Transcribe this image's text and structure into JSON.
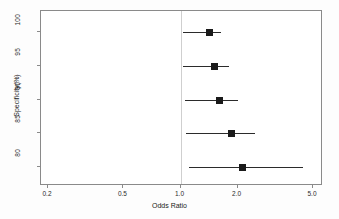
{
  "chart_data": {
    "type": "scatter",
    "subtype": "forest-plot",
    "title": "",
    "xlabel": "Odds Ratio",
    "ylabel": "Specificity(%)",
    "xscale": "log",
    "xlim": [
      0.2,
      5.0
    ],
    "xticks": [
      "0.2",
      "0.5",
      "1.0",
      "2.0",
      "5.0"
    ],
    "xtick_values": [
      0.2,
      0.5,
      1.0,
      2.0,
      5.0
    ],
    "yticks": [
      "100",
      "95",
      "90",
      "85",
      "80"
    ],
    "ytick_values": [
      100,
      95,
      90,
      85,
      80
    ],
    "grid": false,
    "legend": "none",
    "reference_line": 1.0,
    "categories": [
      100,
      95,
      90,
      85,
      80
    ],
    "points": [
      {
        "category": "100",
        "odds_ratio": 1.41,
        "ci_low": 1.03,
        "ci_high": 1.64
      },
      {
        "category": "95",
        "odds_ratio": 1.5,
        "ci_low": 1.03,
        "ci_high": 1.8
      },
      {
        "category": "90",
        "odds_ratio": 1.6,
        "ci_low": 1.05,
        "ci_high": 2.02
      },
      {
        "category": "85",
        "odds_ratio": 1.85,
        "ci_low": 1.07,
        "ci_high": 2.47
      },
      {
        "category": "80",
        "odds_ratio": 2.12,
        "ci_low": 1.11,
        "ci_high": 4.45
      }
    ],
    "colors": {
      "marker": "#1a1a1a",
      "ci_line": "#2b2b2b",
      "reference_line": "#cfcfcf",
      "axis": "#8a8a8a",
      "background": "#ffffff"
    }
  }
}
